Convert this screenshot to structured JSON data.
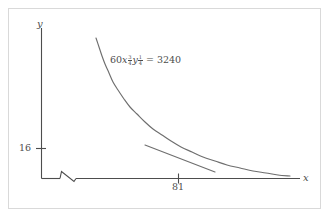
{
  "figure": {
    "title": "",
    "background_color": "#ffffff",
    "frame_color": "#d9d9d9",
    "ink_color": "#4d4d4d"
  },
  "axes": {
    "x_label": "x",
    "y_label": "y",
    "x_ticks": [
      {
        "label": "81",
        "value": 81
      }
    ],
    "y_ticks": [
      {
        "label": "16",
        "value": 16
      }
    ],
    "x_axis_break": true,
    "grid": false
  },
  "annotation": {
    "equation": {
      "coefficient": "60",
      "x_symbol": "x",
      "x_exponent_numerator": "3",
      "x_exponent_denominator": "4",
      "y_symbol": "y",
      "y_exponent_numerator": "1",
      "y_exponent_denominator": "4",
      "equals": "=",
      "right_hand_side": "3240",
      "plain_text": "60x^(3/4) y^(1/4) = 3240"
    }
  },
  "chart_data": {
    "type": "line",
    "title": "",
    "xlabel": "x",
    "ylabel": "y",
    "grid": false,
    "legend": false,
    "annotations": [
      {
        "text": "60x^(3/4) y^(1/4) = 3240",
        "x": 0.33,
        "y": 0.78
      }
    ],
    "axis_break": {
      "axis": "x",
      "position_px": 70
    },
    "tangent_point": {
      "x": 81,
      "y": 16
    },
    "series": [
      {
        "name": "isoquant 60x^(3/4)y^(1/4)=3240",
        "type": "curve",
        "points_px": [
          [
            96,
            38
          ],
          [
            99,
            47
          ],
          [
            102,
            56
          ],
          [
            105,
            64
          ],
          [
            109,
            73
          ],
          [
            113,
            82
          ],
          [
            118,
            90
          ],
          [
            124,
            99
          ],
          [
            130,
            107
          ],
          [
            137,
            114
          ],
          [
            145,
            122
          ],
          [
            153,
            129
          ],
          [
            162,
            135
          ],
          [
            171,
            141
          ],
          [
            181,
            147
          ],
          [
            192,
            152
          ],
          [
            203,
            157
          ],
          [
            215,
            161
          ],
          [
            227,
            165
          ],
          [
            240,
            168
          ],
          [
            253,
            171
          ],
          [
            266,
            173
          ],
          [
            278,
            175
          ],
          [
            290,
            176
          ]
        ]
      },
      {
        "name": "tangent line at (81, 16)",
        "type": "line",
        "points_px": [
          [
            145,
            145
          ],
          [
            215,
            172
          ]
        ]
      }
    ],
    "curve_equation": "60*x^0.75*y^0.25 = 3240"
  }
}
